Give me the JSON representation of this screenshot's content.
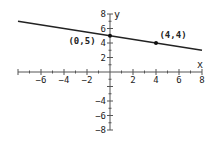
{
  "chart_data": {
    "type": "line",
    "title": "",
    "xlabel": "x",
    "ylabel": "y",
    "xlim": [
      -8,
      8
    ],
    "ylim": [
      -8,
      8
    ],
    "grid": false,
    "x_ticks": [
      -6,
      -4,
      -2,
      2,
      4,
      6,
      8
    ],
    "y_ticks": [
      8,
      6,
      4,
      2,
      -4,
      -6,
      -8
    ],
    "series": [
      {
        "name": "line",
        "equation": "y = -x/4 + 5",
        "x": [
          -8,
          8
        ],
        "y": [
          7,
          3
        ]
      }
    ],
    "points": [
      {
        "x": 0,
        "y": 5,
        "label": "(0,5)"
      },
      {
        "x": 4,
        "y": 4,
        "label": "(4,4)"
      }
    ],
    "colors": {
      "line": "#222222",
      "axis": "#555555",
      "text": "#222222"
    }
  }
}
